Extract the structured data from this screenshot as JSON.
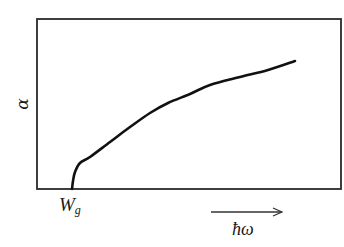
{
  "chart_data": {
    "type": "line",
    "title": "",
    "xlabel": "ħω",
    "ylabel": "α",
    "x_marker": {
      "label": "W",
      "subscript": "g"
    },
    "axis_arrow": {
      "direction": "right",
      "label": "ħω"
    },
    "grid": false,
    "legend": null,
    "ticks": {
      "x": [],
      "y": []
    },
    "series": [
      {
        "name": "absorption coefficient",
        "description": "α rises from zero at the band gap W_g with square-root-like onset",
        "x_rel": [
          0.0,
          0.01,
          0.05,
          0.13,
          0.26,
          0.39,
          0.52,
          0.64,
          0.78,
          1.0
        ],
        "y_rel": [
          0.0,
          0.08,
          0.17,
          0.24,
          0.37,
          0.48,
          0.59,
          0.68,
          0.78,
          0.98
        ]
      }
    ],
    "pixel_geometry": {
      "frame": {
        "x0": 37,
        "y0": 19,
        "x1": 341,
        "y1": 189
      },
      "curve_points": [
        [
          72,
          189
        ],
        [
          73,
          181
        ],
        [
          75,
          172
        ],
        [
          80,
          163
        ],
        [
          90,
          157
        ],
        [
          110,
          142
        ],
        [
          130,
          127
        ],
        [
          150,
          113
        ],
        [
          168,
          103
        ],
        [
          190,
          94
        ],
        [
          210,
          85
        ],
        [
          240,
          77
        ],
        [
          268,
          70
        ],
        [
          295,
          61
        ]
      ],
      "arrow": {
        "x0": 211,
        "x1": 282,
        "y": 212
      }
    }
  },
  "labels": {
    "y_axis": "α",
    "x_marker_main": "W",
    "x_marker_sub": "g",
    "x_axis": "ħω"
  }
}
